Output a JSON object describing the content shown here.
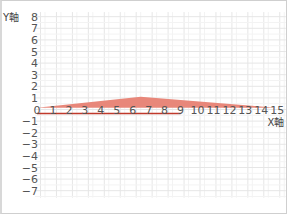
{
  "chart_data": {
    "type": "area",
    "title": "",
    "xlabel": "X軸",
    "ylabel": "Y軸",
    "xlim": [
      0,
      15
    ],
    "ylim": [
      -7,
      8
    ],
    "x_ticks": [
      "0",
      "1",
      "2",
      "3",
      "4",
      "5",
      "6",
      "7",
      "8",
      "9",
      "10",
      "11",
      "12",
      "13",
      "14",
      "15"
    ],
    "y_ticks": [
      "8",
      "7",
      "6",
      "5",
      "4",
      "3",
      "2",
      "1",
      "0",
      "−1",
      "−2",
      "−3",
      "−4",
      "−5",
      "−6",
      "−7"
    ],
    "grid": true,
    "series": [
      {
        "name": "triangle",
        "kind": "polygon",
        "color": "#e8877a",
        "points": [
          [
            0,
            0.15
          ],
          [
            6.5,
            1.1
          ],
          [
            15,
            0.15
          ]
        ]
      },
      {
        "name": "segment",
        "kind": "line",
        "color": "#c0392b",
        "points": [
          [
            0,
            -0.35
          ],
          [
            9,
            -0.35
          ]
        ]
      }
    ]
  }
}
